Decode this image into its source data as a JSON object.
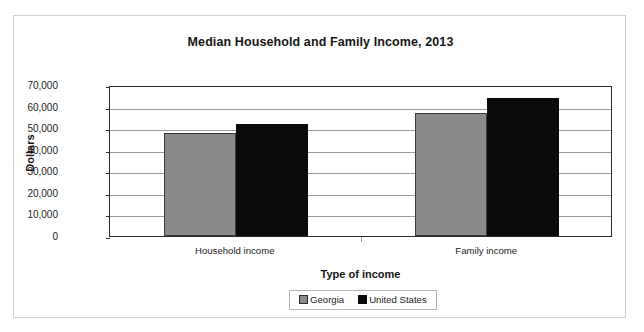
{
  "chart_data": {
    "type": "bar",
    "title": "Median Household and Family Income, 2013",
    "xlabel": "Type of income",
    "ylabel": "Dollars",
    "categories": [
      "Household income",
      "Family income"
    ],
    "series": [
      {
        "name": "Georgia",
        "color": "#8a8a8a",
        "values": [
          47700,
          56800
        ]
      },
      {
        "name": "United States",
        "color": "#0b0b0b",
        "values": [
          52000,
          64000
        ]
      }
    ],
    "ylim": [
      0,
      70000
    ],
    "y_ticks": [
      0,
      10000,
      20000,
      30000,
      40000,
      50000,
      60000,
      70000
    ],
    "y_tick_labels": [
      "0",
      "10,000",
      "20,000",
      "30,000",
      "40,000",
      "50,000",
      "60,000",
      "70,000"
    ],
    "grid": true,
    "legend_position": "bottom"
  },
  "legend": {
    "entries": [
      {
        "label": "Georgia"
      },
      {
        "label": "United States"
      }
    ]
  }
}
